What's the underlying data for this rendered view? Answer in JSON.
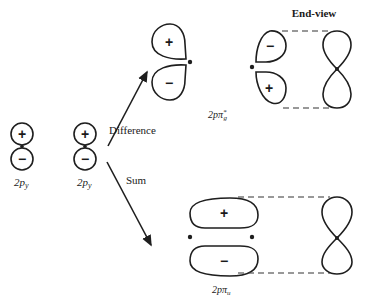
{
  "diagram": {
    "atomic_orbitals": [
      {
        "label_main": "2p",
        "label_sub": "y",
        "upper_sign": "+",
        "lower_sign": "−"
      },
      {
        "label_main": "2p",
        "label_sub": "y",
        "upper_sign": "+",
        "lower_sign": "−"
      }
    ],
    "arrows": {
      "difference_label": "Difference",
      "sum_label": "Sum"
    },
    "antibonding": {
      "label_main": "2pπ",
      "label_sub": "g",
      "label_sup": "*",
      "left_upper_sign": "+",
      "left_lower_sign": "−",
      "right_upper_sign": "−",
      "right_lower_sign": "+"
    },
    "bonding": {
      "label_main": "2pπ",
      "label_sub": "u",
      "upper_sign": "+",
      "lower_sign": "−"
    },
    "end_view_label": "End-view"
  }
}
